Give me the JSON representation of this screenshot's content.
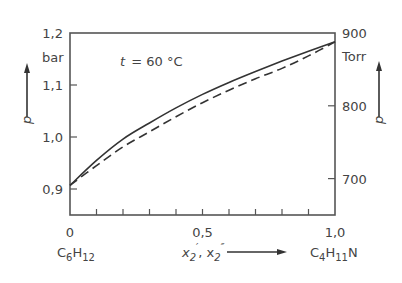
{
  "chart_data": {
    "type": "line",
    "title": "",
    "annotation": "t = 60 °C",
    "annotation_var": "t",
    "annotation_value": "= 60 °C",
    "xlabel": "x'2, x''2",
    "xlabel_left_component": "C6H12",
    "xlabel_right_component": "C4H11N",
    "ylabel_left": "p",
    "ylabel_left_unit": "bar",
    "ylabel_right": "p",
    "ylabel_right_unit": "Torr",
    "xlim": [
      0,
      1.0
    ],
    "ylim_left": [
      0.85,
      1.2
    ],
    "ylim_right": [
      650,
      900
    ],
    "x_ticks": [
      0,
      0.5,
      1.0
    ],
    "x_tick_labels": [
      "0",
      "0,5",
      "1,0"
    ],
    "x_minor_ticks": [
      0.1,
      0.2,
      0.3,
      0.4,
      0.6,
      0.7,
      0.8,
      0.9
    ],
    "y_left_ticks": [
      0.9,
      1.0,
      1.1,
      1.2
    ],
    "y_left_tick_labels": [
      "0,9",
      "1,0",
      "1,1",
      "1,2"
    ],
    "y_right_ticks": [
      700,
      800,
      900
    ],
    "y_right_tick_labels": [
      "700",
      "800",
      "900"
    ],
    "grid": false,
    "legend": "none",
    "x": [
      0,
      0.1,
      0.2,
      0.3,
      0.4,
      0.5,
      0.6,
      0.7,
      0.8,
      0.9,
      1.0
    ],
    "series": [
      {
        "name": "boiling curve p(x'2) (liquid)",
        "style": "solid",
        "values": [
          0.907,
          0.955,
          0.996,
          1.027,
          1.056,
          1.082,
          1.105,
          1.126,
          1.146,
          1.165,
          1.183
        ]
      },
      {
        "name": "dew curve p(x''2) (vapor)",
        "style": "dashed",
        "values": [
          0.907,
          0.945,
          0.981,
          1.01,
          1.039,
          1.066,
          1.09,
          1.112,
          1.132,
          1.156,
          1.183
        ]
      }
    ]
  }
}
